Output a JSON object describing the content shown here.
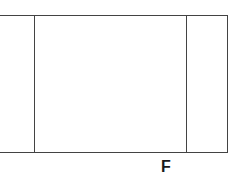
{
  "figure": {
    "type": "line-diagram",
    "background_color": "#ffffff",
    "stroke_color": "#434343",
    "stroke_width_px": 1,
    "canvas": {
      "width": 244,
      "height": 188
    },
    "labels": [
      {
        "id": "label-f",
        "text": "F",
        "color": "#1a1a1a",
        "font_size_px": 16,
        "font_weight": "bold",
        "x": 166,
        "y": 167
      }
    ],
    "segments": [
      {
        "id": "top-edge",
        "orientation": "horizontal",
        "x1": 0,
        "y1": 15,
        "x2": 227,
        "y2": 15
      },
      {
        "id": "bottom-edge",
        "orientation": "horizontal",
        "x1": 0,
        "y1": 152,
        "x2": 227,
        "y2": 152
      },
      {
        "id": "left-divider",
        "orientation": "vertical",
        "x1": 34,
        "y1": 15,
        "x2": 34,
        "y2": 152
      },
      {
        "id": "right-divider",
        "orientation": "vertical",
        "x1": 186,
        "y1": 15,
        "x2": 186,
        "y2": 152
      },
      {
        "id": "right-edge",
        "orientation": "vertical",
        "x1": 227,
        "y1": 15,
        "x2": 227,
        "y2": 152
      }
    ],
    "regions": [
      {
        "id": "left-strip",
        "x": 0,
        "width": 34,
        "description": "narrow open strip left of first divider"
      },
      {
        "id": "center-panel",
        "x": 34,
        "width": 152,
        "description": "large central rectangular panel"
      },
      {
        "id": "right-panel",
        "x": 186,
        "width": 41,
        "description": "narrow rectangular panel at right"
      }
    ]
  }
}
